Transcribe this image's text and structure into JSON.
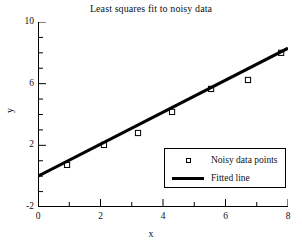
{
  "chart_data": {
    "type": "scatter",
    "title": "Least squares fit to noisy data",
    "xlabel": "x",
    "ylabel": "y",
    "xlim": [
      0,
      8
    ],
    "ylim": [
      -2,
      10
    ],
    "grid": false,
    "legend_position": "lower right",
    "x_major_ticks": [
      0,
      2,
      4,
      6,
      8
    ],
    "x_minor_ticks": [
      1,
      3,
      5,
      7
    ],
    "y_major_ticks": [
      -2,
      2,
      6,
      10
    ],
    "y_minor_ticks": [
      -1,
      0,
      1,
      3,
      4,
      5,
      7,
      8,
      9
    ],
    "x_tick_labels": [
      "0",
      "2",
      "4",
      "6",
      "8"
    ],
    "y_tick_labels": [
      "-2",
      "2",
      "6",
      "10"
    ],
    "series": [
      {
        "name": "Noisy data points",
        "type": "scatter",
        "marker": "square-open",
        "color": "#000000",
        "x": [
          0.93,
          2.11,
          3.2,
          4.29,
          5.54,
          6.72,
          7.78
        ],
        "y": [
          0.73,
          2.03,
          2.8,
          4.17,
          5.66,
          6.24,
          8.0
        ]
      },
      {
        "name": "Fitted line",
        "type": "line",
        "color": "#000000",
        "linewidth": 3,
        "x": [
          0.0,
          8.0
        ],
        "y": [
          0.0,
          8.3
        ]
      }
    ],
    "legend_entries": [
      {
        "label": "Noisy data points",
        "key": "square-open-marker"
      },
      {
        "label": "Fitted line",
        "key": "thick-line"
      }
    ]
  }
}
